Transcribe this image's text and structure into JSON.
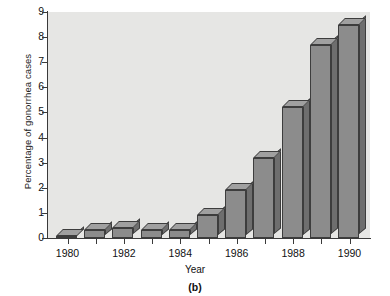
{
  "figure": {
    "caption": "(b)"
  },
  "chart_data": {
    "type": "bar",
    "title": "",
    "xlabel": "Year",
    "ylabel": "Percentage of gonorrhea cases",
    "categories": [
      "1980",
      "1981",
      "1982",
      "1983",
      "1984",
      "1985",
      "1986",
      "1987",
      "1988",
      "1989",
      "1990"
    ],
    "values": [
      0.1,
      0.3,
      0.4,
      0.3,
      0.3,
      0.9,
      1.9,
      3.2,
      5.2,
      7.7,
      8.5
    ],
    "ylim": [
      0,
      9
    ],
    "yticks": [
      0,
      1,
      2,
      3,
      4,
      5,
      6,
      7,
      8,
      9
    ],
    "ytick_labels": [
      "0",
      "1",
      "2",
      "3",
      "4",
      "5",
      "6",
      "7",
      "8",
      "9"
    ],
    "xtick_labels": [
      "1980",
      "1982",
      "1984",
      "1986",
      "1988",
      "1990"
    ],
    "grid": false,
    "legend": null,
    "style": "3d-bars",
    "colors": {
      "bar_front": "#8c8c8c",
      "bar_side": "#6e6e6e",
      "bar_top": "#a0a0a0",
      "bar_edge": "#3d3d3d",
      "plot_background": "#e6e6e4",
      "axis": "#3a3a3a",
      "text": "#111111"
    }
  }
}
